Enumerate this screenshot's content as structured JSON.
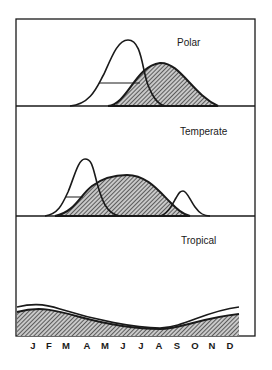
{
  "figure": {
    "panels": [
      {
        "id": "polar",
        "label": "Polar"
      },
      {
        "id": "temperate",
        "label": "Temperate"
      },
      {
        "id": "tropical",
        "label": "Tropical"
      }
    ],
    "x_axis": {
      "months": [
        "J",
        "F",
        "M",
        "A",
        "M",
        "J",
        "J",
        "A",
        "S",
        "O",
        "N",
        "D"
      ]
    },
    "legend_shading": {
      "open_curve": "unshaded",
      "hatched_curve": "hatched"
    },
    "colors": {
      "line": "#1a1a1a",
      "hatch": "#2b2b2b",
      "background": "#ffffff"
    }
  }
}
